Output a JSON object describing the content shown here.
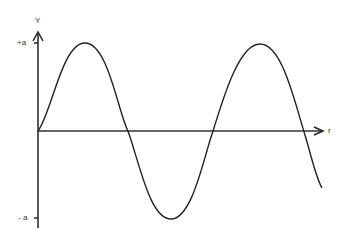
{
  "diagram": {
    "y_axis_label": "Y",
    "x_axis_label": "r",
    "y_max_label": "+a",
    "y_min_label": "- a",
    "colors": {
      "line": "#222222",
      "background": "#ffffff"
    }
  }
}
